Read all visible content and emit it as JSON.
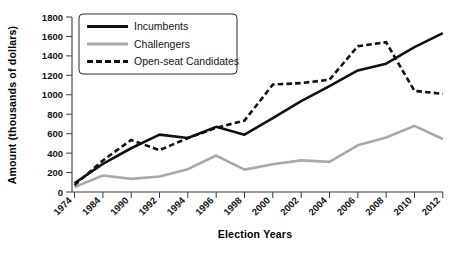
{
  "chart_data": {
    "type": "line",
    "title": "",
    "xlabel": "Election Years",
    "ylabel": "Amount (thousands of dollars)",
    "categories": [
      "1974",
      "1984",
      "1990",
      "1992",
      "1994",
      "1996",
      "1998",
      "2000",
      "2002",
      "2004",
      "2006",
      "2008",
      "2010",
      "2012"
    ],
    "x": [
      1974,
      1984,
      1990,
      1992,
      1994,
      1996,
      1998,
      2000,
      2002,
      2004,
      2006,
      2008,
      2010,
      2012
    ],
    "ylim": [
      0,
      1800
    ],
    "yticks": [
      "0",
      "200",
      "400",
      "600",
      "800",
      "1000",
      "1200",
      "1400",
      "1600",
      "1800"
    ],
    "grid": false,
    "legend_position": "top-left",
    "series": [
      {
        "name": "Incumbents",
        "style": "solid",
        "color": "#111111",
        "values": [
          90,
          290,
          450,
          590,
          555,
          670,
          590,
          760,
          935,
          1090,
          1250,
          1320,
          1490,
          1635
        ]
      },
      {
        "name": "Challengers",
        "style": "solid",
        "color": "#a9a9a9",
        "values": [
          50,
          170,
          135,
          160,
          235,
          375,
          230,
          285,
          325,
          310,
          480,
          560,
          680,
          545
        ]
      },
      {
        "name": "Open-seat Candidates",
        "style": "dashed",
        "color": "#111111",
        "values": [
          70,
          325,
          535,
          430,
          555,
          660,
          735,
          1105,
          1120,
          1155,
          1500,
          1540,
          1040,
          1010
        ]
      }
    ]
  },
  "legend": {
    "items": [
      {
        "label": "Incumbents",
        "swatch": "solid-black-line"
      },
      {
        "label": "Challengers",
        "swatch": "solid-gray-line"
      },
      {
        "label": "Open-seat Candidates",
        "swatch": "dashed-black-line"
      }
    ]
  },
  "axes": {
    "y_title": "Amount (thousands of dollars)",
    "x_title": "Election Years"
  },
  "artifact": {
    "text": "· ·  ·"
  }
}
